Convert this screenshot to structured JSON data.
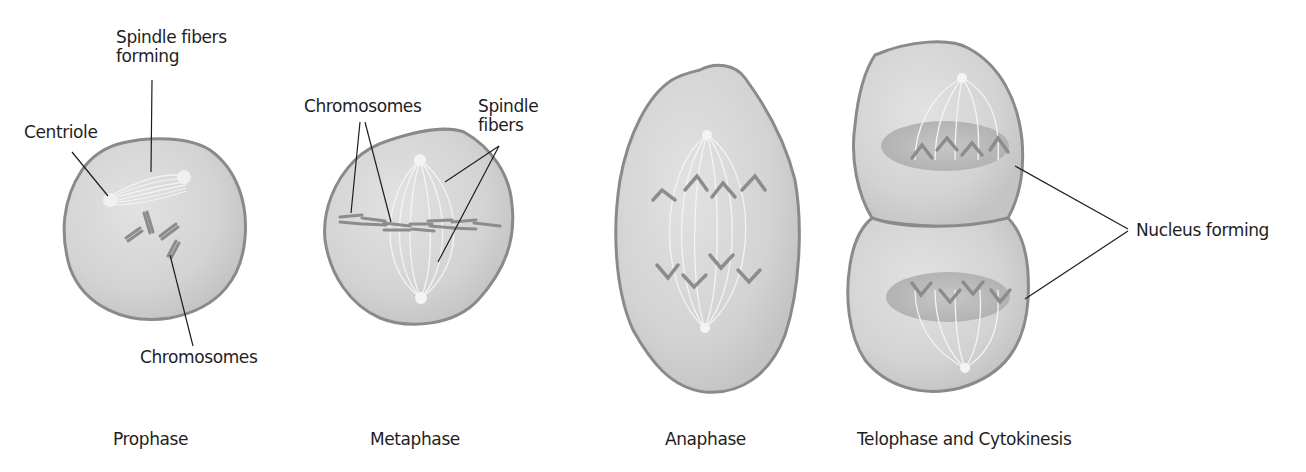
{
  "diagram": {
    "stages": [
      {
        "name": "Prophase",
        "labels": [
          "Spindle fibers forming",
          "Centriole",
          "Chromosomes"
        ]
      },
      {
        "name": "Metaphase",
        "labels": [
          "Chromosomes",
          "Spindle fibers"
        ]
      },
      {
        "name": "Anaphase",
        "labels": []
      },
      {
        "name": "Telophase and Cytokinesis",
        "labels": [
          "Nucleus forming"
        ]
      }
    ],
    "text": {
      "prophase_spindle_line1": "Spindle fibers",
      "prophase_spindle_line2": "forming",
      "prophase_centriole": "Centriole",
      "prophase_chromosomes": "Chromosomes",
      "metaphase_chromosomes": "Chromosomes",
      "metaphase_spindle_line1": "Spindle",
      "metaphase_spindle_line2": "fibers",
      "telophase_nucleus": "Nucleus forming",
      "caption_prophase": "Prophase",
      "caption_metaphase": "Metaphase",
      "caption_anaphase": "Anaphase",
      "caption_telophase": "Telophase and Cytokinesis"
    },
    "colors": {
      "cell_fill": "#d4d4d4",
      "cell_edge": "#8a8a8a",
      "chromosome": "#8c8c8c",
      "nucleus": "#b6b6b6",
      "spindle": "#f2f2f2",
      "leader_line": "#1e1e1e"
    }
  }
}
